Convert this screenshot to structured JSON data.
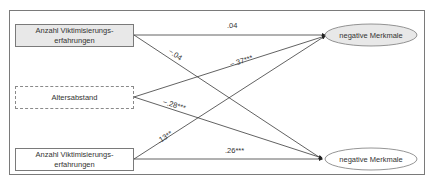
{
  "diagram": {
    "type": "path-model",
    "predictors": [
      {
        "id": "p1",
        "label_line1": "Anzahl Viktimisierungs-",
        "label_line2": "erfahrungen",
        "style": "shaded"
      },
      {
        "id": "p2",
        "label_line1": "Altersabstand",
        "label_line2": "",
        "style": "dashed"
      },
      {
        "id": "p3",
        "label_line1": "Anzahl Viktimisierungs-",
        "label_line2": "erfahrungen",
        "style": "plain"
      }
    ],
    "outcomes": [
      {
        "id": "o1",
        "label": "negative Merkmale",
        "style": "shaded"
      },
      {
        "id": "o2",
        "label": "negative Merkmale",
        "style": "plain"
      }
    ],
    "paths": [
      {
        "from": "p1",
        "to": "o1",
        "coefficient": ".04"
      },
      {
        "from": "p1",
        "to": "o2",
        "coefficient": "−.04"
      },
      {
        "from": "p2",
        "to": "o1",
        "coefficient": "−.37***"
      },
      {
        "from": "p2",
        "to": "o2",
        "coefficient": "−.28***"
      },
      {
        "from": "p3",
        "to": "o1",
        "coefficient": ".13**"
      },
      {
        "from": "p3",
        "to": "o2",
        "coefficient": ".26***"
      }
    ]
  },
  "colors": {
    "line": "#3a3a3a",
    "box_border": "#7a7a7a",
    "shaded_fill": "#e8e8e8",
    "text": "#333333"
  }
}
